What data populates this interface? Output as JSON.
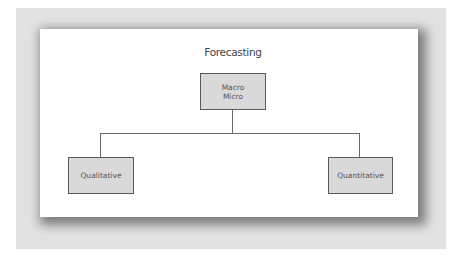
{
  "diagram": {
    "title": "Forecasting",
    "root": {
      "line1": "Macro",
      "line2": "Micro"
    },
    "children": [
      {
        "label": "Qualitative"
      },
      {
        "label": "Quantitative"
      }
    ]
  },
  "colors": {
    "frame": "#e2e2e2",
    "panel": "#ffffff",
    "box_fill": "#d9d9d9",
    "box_border": "#5a5a5a",
    "line": "#6a6a6a",
    "text": "#444444"
  }
}
